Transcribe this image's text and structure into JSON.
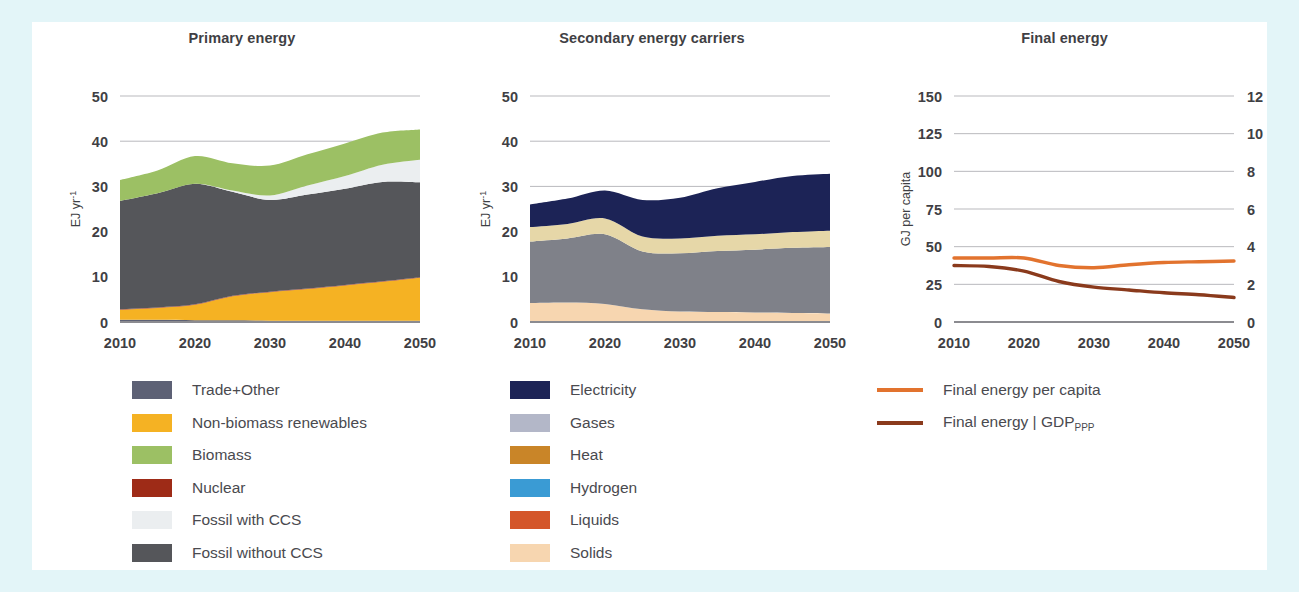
{
  "figure": {
    "background_color": "#e3f5f8",
    "card_color": "#ffffff"
  },
  "panels": {
    "primary": {
      "title": "Primary energy",
      "ylabel": "EJ yr-1"
    },
    "secondary": {
      "title": "Secondary energy carriers",
      "ylabel": "EJ yr-1"
    },
    "final": {
      "title": "Final energy",
      "ylabel_left": "GJ per capita",
      "ylabel_right": "GJ USD2010-1"
    }
  },
  "legends": {
    "primary": [
      {
        "label": "Trade+Other",
        "color": "#5d6175"
      },
      {
        "label": "Non-biomass renewables",
        "color": "#f5b223"
      },
      {
        "label": "Biomass",
        "color": "#9cc濃"
      },
      {
        "label": "Nuclear",
        "color": "#9e2b17"
      },
      {
        "label": "Fossil with CCS",
        "color": "#ebeef0"
      },
      {
        "label": "Fossil without CCS",
        "color": "#55565a"
      }
    ],
    "secondary": [
      {
        "label": "Electricity",
        "color": "#1c2356"
      },
      {
        "label": "Gases",
        "color": "#b3b7c8"
      },
      {
        "label": "Heat",
        "color": "#c98528"
      },
      {
        "label": "Hydrogen",
        "color": "#3a9bd4"
      },
      {
        "label": "Liquids",
        "color": "#d4562a"
      },
      {
        "label": "Solids",
        "color": "#f7d6b0"
      }
    ],
    "final": [
      {
        "label": "Final energy per capita",
        "color": "#e2732e",
        "style": "line"
      },
      {
        "label": "Final energy | GDP",
        "sub": "PPP",
        "color": "#8a3a1c",
        "style": "line"
      }
    ]
  },
  "chart_data": [
    {
      "id": "primary",
      "type": "area",
      "stacked": true,
      "title": "Primary energy",
      "xlabel": "",
      "ylabel": "EJ yr-1",
      "xlim": [
        2010,
        2050
      ],
      "ylim": [
        0,
        50
      ],
      "yticks": [
        0,
        10,
        20,
        30,
        40,
        50
      ],
      "xticks": [
        2010,
        2020,
        2030,
        2040,
        2050
      ],
      "grid": true,
      "x": [
        2010,
        2015,
        2020,
        2025,
        2030,
        2035,
        2040,
        2045,
        2050
      ],
      "series": [
        {
          "name": "Trade+Other",
          "color": "#5d6175",
          "values": [
            0.5,
            0.5,
            0.4,
            0.4,
            0.3,
            0.3,
            0.3,
            0.3,
            0.3
          ]
        },
        {
          "name": "Non-biomass renewables",
          "color": "#f5b223",
          "values": [
            2.2,
            2.6,
            3.4,
            5.3,
            6.3,
            7.0,
            7.8,
            8.6,
            9.5
          ]
        },
        {
          "name": "Nuclear",
          "color": "#9e2b17",
          "values": [
            0.1,
            0.1,
            0.1,
            0.1,
            0.1,
            0.1,
            0.1,
            0.1,
            0.1
          ]
        },
        {
          "name": "Fossil without CCS",
          "color": "#55565a",
          "values": [
            24.0,
            25.3,
            26.7,
            23.0,
            20.3,
            20.8,
            21.3,
            22.0,
            21.0
          ]
        },
        {
          "name": "Fossil with CCS",
          "color": "#ebeef0",
          "values": [
            0.0,
            0.0,
            0.0,
            0.3,
            1.0,
            2.0,
            2.8,
            3.8,
            5.0
          ]
        },
        {
          "name": "Biomass",
          "color": "#9cc064",
          "values": [
            4.6,
            5.0,
            6.1,
            6.0,
            6.6,
            6.9,
            7.2,
            7.1,
            6.7
          ]
        }
      ],
      "totals": [
        31.4,
        33.5,
        36.7,
        35.1,
        34.6,
        37.1,
        39.5,
        41.9,
        42.6
      ]
    },
    {
      "id": "secondary",
      "type": "area",
      "stacked": true,
      "title": "Secondary energy carriers",
      "xlabel": "",
      "ylabel": "EJ yr-1",
      "xlim": [
        2010,
        2050
      ],
      "ylim": [
        0,
        50
      ],
      "yticks": [
        0,
        10,
        20,
        30,
        40,
        50
      ],
      "xticks": [
        2010,
        2020,
        2030,
        2040,
        2050
      ],
      "grid": true,
      "x": [
        2010,
        2015,
        2020,
        2025,
        2030,
        2035,
        2040,
        2045,
        2050
      ],
      "series": [
        {
          "name": "Solids",
          "color": "#f7d6b0",
          "values": [
            4.2,
            4.3,
            4.0,
            2.8,
            2.3,
            2.2,
            2.1,
            2.0,
            1.9
          ]
        },
        {
          "name": "Liquids",
          "color": "#d4562a",
          "values": [
            0.0,
            0.0,
            0.0,
            0.0,
            0.0,
            0.0,
            0.0,
            0.0,
            0.0
          ]
        },
        {
          "name": "Gases",
          "color": "#7f8189",
          "values": [
            13.6,
            14.2,
            15.4,
            12.8,
            12.9,
            13.5,
            13.9,
            14.4,
            14.7
          ]
        },
        {
          "name": "Hydrogen",
          "color": "#3a9bd4",
          "values": [
            0.0,
            0.0,
            0.0,
            0.0,
            0.0,
            0.0,
            0.0,
            0.0,
            0.0
          ]
        },
        {
          "name": "Heat",
          "color": "#e6d7a8",
          "values": [
            3.2,
            3.2,
            3.5,
            3.3,
            3.3,
            3.4,
            3.4,
            3.5,
            3.6
          ]
        },
        {
          "name": "Electricity",
          "color": "#1c2356",
          "values": [
            5.0,
            5.6,
            6.2,
            8.1,
            9.0,
            10.5,
            11.6,
            12.4,
            12.6
          ]
        }
      ],
      "totals": [
        26.0,
        27.3,
        29.1,
        27.0,
        27.5,
        29.6,
        31.0,
        32.3,
        32.8
      ]
    },
    {
      "id": "final",
      "type": "line",
      "title": "Final energy",
      "xlabel": "",
      "ylabel_left": "GJ per capita",
      "ylabel_right": "GJ USD2010-1",
      "xlim": [
        2010,
        2050
      ],
      "ylim_left": [
        0,
        150
      ],
      "ylim_right": [
        0,
        12
      ],
      "yticks_left": [
        0,
        25,
        50,
        75,
        100,
        125,
        150
      ],
      "yticks_right": [
        0,
        2,
        4,
        6,
        8,
        10,
        12
      ],
      "xticks": [
        2010,
        2020,
        2030,
        2040,
        2050
      ],
      "grid": true,
      "x": [
        2010,
        2015,
        2020,
        2025,
        2030,
        2035,
        2040,
        2045,
        2050
      ],
      "series": [
        {
          "name": "Final energy per capita",
          "axis": "left",
          "color": "#e2732e",
          "values": [
            42.5,
            42.5,
            42.5,
            37.5,
            36.0,
            38.0,
            39.5,
            40.0,
            40.5
          ]
        },
        {
          "name": "Final energy | GDP_PPP",
          "axis": "right",
          "color": "#8a3a1c",
          "values": [
            3.0,
            2.95,
            2.7,
            2.15,
            1.85,
            1.7,
            1.55,
            1.45,
            1.3
          ]
        }
      ]
    }
  ]
}
